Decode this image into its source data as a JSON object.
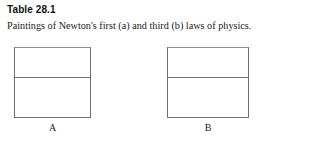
{
  "figure": {
    "number_label": "Table 28.1",
    "caption": "Paintings of Newton's first (a) and third (b) laws of physics.",
    "border_color": "#6f6f6f",
    "background_color": "#ffffff",
    "panels": [
      {
        "label": "A",
        "cells": [
          {
            "content": ""
          },
          {
            "content": ""
          }
        ]
      },
      {
        "label": "B",
        "cells": [
          {
            "content": ""
          },
          {
            "content": ""
          }
        ]
      }
    ]
  }
}
